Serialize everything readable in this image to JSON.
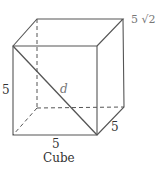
{
  "diagram": {
    "title": "Cube",
    "labels": {
      "height": "5",
      "width": "5",
      "depth": "5",
      "diagonal": "d",
      "face_diagonal": "5 √2"
    },
    "vertices": {
      "front_top_left": [
        13,
        46
      ],
      "front_top_right": [
        97,
        46
      ],
      "front_bottom_left": [
        13,
        135
      ],
      "front_bottom_right": [
        97,
        135
      ],
      "back_top_left": [
        37,
        19
      ],
      "back_top_right": [
        123,
        19
      ],
      "back_bottom_left": [
        37,
        108
      ],
      "back_bottom_right": [
        124,
        107
      ]
    },
    "colors": {
      "edge": "#555555",
      "text": "#333333",
      "muted_text": "#777777"
    }
  }
}
